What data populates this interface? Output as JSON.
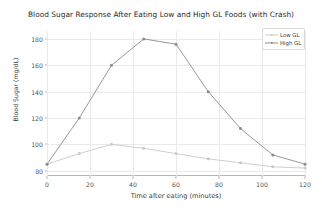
{
  "chart_data": {
    "type": "line",
    "title": "Blood Sugar Response After Eating Low and High GL Foods (with Crash)",
    "xlabel": "Time after eating (minutes)",
    "ylabel": "Blood Sugar (mg/dL)",
    "x": [
      0,
      15,
      30,
      45,
      60,
      75,
      90,
      105,
      120
    ],
    "series": [
      {
        "name": "Low GL",
        "color": "#c9c9c9",
        "marker": "circle",
        "values": [
          85,
          93,
          100,
          97,
          93,
          89,
          86,
          83,
          82
        ]
      },
      {
        "name": "High GL",
        "color": "#8c8c8c",
        "marker": "circle",
        "values": [
          85,
          120,
          160,
          180,
          176,
          140,
          112,
          92,
          85
        ]
      }
    ],
    "xlim": [
      0,
      120
    ],
    "ylim": [
      76,
      186
    ],
    "xticks": [
      0,
      20,
      40,
      60,
      80,
      100,
      120
    ],
    "yticks": [
      80,
      100,
      120,
      140,
      160,
      180
    ],
    "xtick_labels": [
      "0",
      "20",
      "40",
      "60",
      "80",
      "100",
      "120"
    ],
    "ytick_labels": [
      "80",
      "100",
      "120",
      "140",
      "160",
      "180"
    ],
    "grid": true,
    "grid_color": "#e9e9ee",
    "legend_position": "top-right",
    "background": "#ffffff"
  }
}
